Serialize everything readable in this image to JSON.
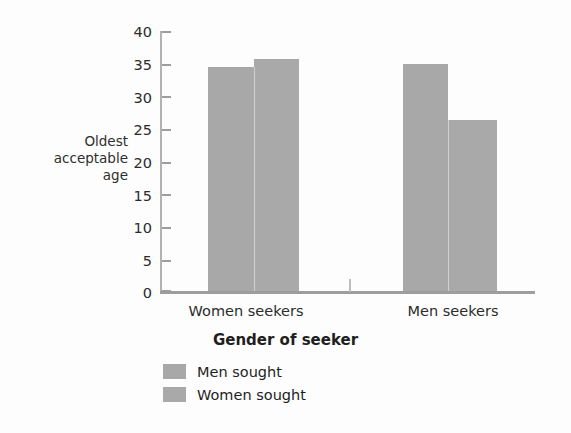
{
  "chart_data": {
    "type": "bar",
    "title": "",
    "xlabel": "Gender of seeker",
    "ylabel": "Oldest acceptable age",
    "ylabel_lines": [
      "Oldest",
      "acceptable",
      "age"
    ],
    "categories": [
      "Women seekers",
      "Men seekers"
    ],
    "series": [
      {
        "name": "Men sought",
        "values": [
          34.5,
          35.0
        ],
        "color": "#a8a8a8"
      },
      {
        "name": "Women sought",
        "values": [
          35.7,
          26.3
        ],
        "color": "#a9a9a9"
      }
    ],
    "ylim": [
      0,
      40
    ],
    "ytick_labels": [
      "40",
      "35",
      "30",
      "25",
      "20",
      "15",
      "10",
      "5",
      "0"
    ],
    "ytick_values": [
      40,
      35,
      30,
      25,
      20,
      15,
      10,
      5,
      0
    ],
    "ytick_step": 5,
    "grid": false,
    "legend_position": "below-left",
    "bar_gap_between_groups": true,
    "title_remnant": ""
  }
}
